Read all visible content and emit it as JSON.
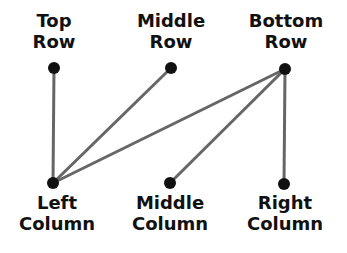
{
  "diagram": {
    "type": "bipartite-graph",
    "colors": {
      "node": "#111111",
      "edge": "#666666",
      "text": "#111111",
      "background": "#ffffff"
    },
    "top_nodes": [
      {
        "id": "top_row",
        "line1": "Top",
        "line2": "Row",
        "x": 54,
        "y": 68
      },
      {
        "id": "middle_row",
        "line1": "Middle",
        "line2": "Row",
        "x": 171,
        "y": 68
      },
      {
        "id": "bottom_row",
        "line1": "Bottom",
        "line2": "Row",
        "x": 285,
        "y": 69
      }
    ],
    "bottom_nodes": [
      {
        "id": "left_column",
        "line1": "Left",
        "line2": "Column",
        "x": 53,
        "y": 183
      },
      {
        "id": "middle_column",
        "line1": "Middle",
        "line2": "Column",
        "x": 170,
        "y": 183
      },
      {
        "id": "right_column",
        "line1": "Right",
        "line2": "Column",
        "x": 284,
        "y": 184
      }
    ],
    "edges": [
      {
        "from": "top_row",
        "to": "left_column"
      },
      {
        "from": "middle_row",
        "to": "left_column"
      },
      {
        "from": "bottom_row",
        "to": "left_column"
      },
      {
        "from": "bottom_row",
        "to": "middle_column"
      },
      {
        "from": "bottom_row",
        "to": "right_column"
      }
    ]
  }
}
